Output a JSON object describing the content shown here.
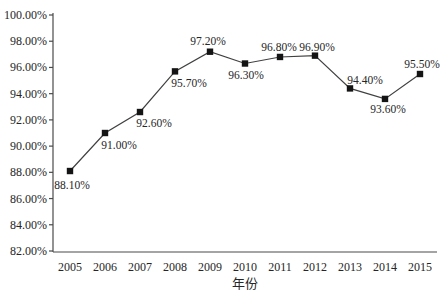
{
  "chart_data": {
    "type": "line",
    "title": "",
    "xlabel": "年份",
    "ylabel": "",
    "categories": [
      "2005",
      "2006",
      "2007",
      "2008",
      "2009",
      "2010",
      "2011",
      "2012",
      "2013",
      "2014",
      "2015"
    ],
    "series": [
      {
        "name": "",
        "values": [
          88.1,
          91.0,
          92.6,
          95.7,
          97.2,
          96.3,
          96.8,
          96.9,
          94.4,
          93.6,
          95.5
        ]
      }
    ],
    "point_labels": [
      "88.10%",
      "91.00%",
      "92.60%",
      "95.70%",
      "97.20%",
      "96.30%",
      "96.80%",
      "96.90%",
      "94.40%",
      "93.60%",
      "95.50%"
    ],
    "y_axis": {
      "min": 82,
      "max": 100,
      "step": 2,
      "tick_labels": [
        "100.00%",
        "98.00%",
        "96.00%",
        "94.00%",
        "92.00%",
        "90.00%",
        "88.00%",
        "86.00%",
        "84.00%",
        "82.00%"
      ]
    },
    "grid": false,
    "legend": "none",
    "marker": "filled-square",
    "colors": {
      "line": "#404040",
      "marker": "#141414",
      "axis": "#4a4a4a",
      "text": "#262626",
      "background": "#ffffff"
    },
    "label_placement": [
      {
        "dx": 2,
        "dy": 18
      },
      {
        "dx": 14,
        "dy": 16
      },
      {
        "dx": 14,
        "dy": 15
      },
      {
        "dx": 14,
        "dy": 16
      },
      {
        "dx": -2,
        "dy": -7
      },
      {
        "dx": 1,
        "dy": 15
      },
      {
        "dx": -1,
        "dy": -6
      },
      {
        "dx": 2,
        "dy": -5
      },
      {
        "dx": 15,
        "dy": -4
      },
      {
        "dx": 3,
        "dy": 14
      },
      {
        "dx": 2,
        "dy": -6
      }
    ]
  }
}
